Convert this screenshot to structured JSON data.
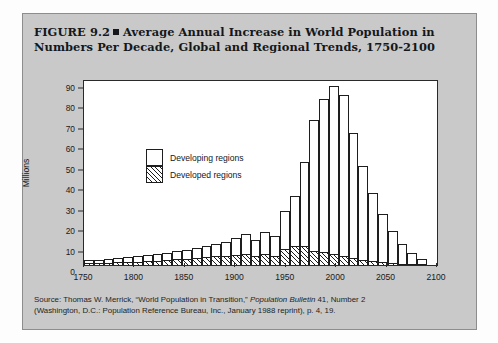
{
  "figure": {
    "title_line1": "FIGURE 9.2",
    "title_marker": "square-bullet",
    "title_line1b": "Average Annual Increase in World Population in",
    "title_line2": "Numbers Per Decade, Global and Regional Trends, 1750-2100",
    "source_line1_a": "Source: Thomas W. Merrick, “World Population in Transition,” ",
    "source_line1_italic": "Population Bulletin",
    "source_line1_b": " 41, Number 2",
    "source_line2": "(Washington, D.C.: Population Reference Bureau, Inc., January 1988 reprint), p. 4, 19."
  },
  "chart_data": {
    "type": "bar",
    "stacked": true,
    "title": "Average Annual Increase in World Population in Numbers Per Decade, Global and Regional Trends, 1750-2100",
    "xlabel": "",
    "ylabel": "Millions",
    "xlim": [
      1750,
      2100
    ],
    "ylim": [
      0,
      90
    ],
    "ytick_step": 10,
    "xtick_step": 50,
    "grid": false,
    "legend_position": "inside-upper-left",
    "yticks": [
      0,
      10,
      20,
      30,
      40,
      50,
      60,
      70,
      80,
      90
    ],
    "ytick_labels": [
      "0",
      "10",
      "20",
      "30",
      "40",
      "50",
      "60",
      "70",
      "80",
      "90"
    ],
    "xticks": [
      1750,
      1800,
      1850,
      1900,
      1950,
      2000,
      2050,
      2100
    ],
    "xtick_labels": [
      "1750",
      "1800",
      "1850",
      "1900",
      "1950",
      "2000",
      "2050",
      "2100"
    ],
    "categories": [
      1750,
      1760,
      1770,
      1780,
      1790,
      1800,
      1810,
      1820,
      1830,
      1840,
      1850,
      1860,
      1870,
      1880,
      1890,
      1900,
      1910,
      1920,
      1930,
      1940,
      1950,
      1960,
      1970,
      1980,
      1990,
      2000,
      2010,
      2020,
      2030,
      2040,
      2050,
      2060,
      2070,
      2080,
      2090
    ],
    "series": [
      {
        "name": "Developed regions",
        "pattern": "diagonal-hatch",
        "color": "#ffffff",
        "values": [
          1.0,
          1.1,
          1.2,
          1.3,
          1.5,
          1.7,
          1.9,
          2.2,
          2.5,
          2.8,
          3.1,
          3.4,
          3.8,
          4.2,
          4.6,
          5.1,
          5.4,
          4.2,
          5.6,
          4.6,
          8.0,
          9.4,
          9.2,
          6.9,
          6.4,
          5.4,
          4.4,
          3.4,
          2.6,
          1.9,
          1.4,
          1.0,
          0.7,
          0.5,
          0.3
        ]
      },
      {
        "name": "Developing regions",
        "pattern": "solid-white",
        "color": "#ffffff",
        "values": [
          1.4,
          1.6,
          1.8,
          2.0,
          2.2,
          2.5,
          2.8,
          3.1,
          3.5,
          3.9,
          4.4,
          4.9,
          5.5,
          6.2,
          6.9,
          8.0,
          9.6,
          8.0,
          10.4,
          9.4,
          18.5,
          24.6,
          41.4,
          64.0,
          74.7,
          82.0,
          78.6,
          61.0,
          46.0,
          33.4,
          23.4,
          15.6,
          9.8,
          5.3,
          2.4
        ]
      }
    ],
    "totals": [
      2.4,
      2.7,
      3.0,
      3.3,
      3.7,
      4.2,
      4.7,
      5.3,
      6.0,
      6.7,
      7.5,
      8.3,
      9.3,
      10.4,
      11.5,
      13.1,
      15.0,
      12.2,
      16.0,
      14.0,
      26.5,
      34.0,
      50.6,
      70.9,
      81.1,
      87.4,
      83.0,
      64.4,
      48.6,
      35.3,
      24.8,
      16.6,
      10.5,
      5.8,
      2.7
    ],
    "peak_value": 87.4,
    "peak_category": 2000
  },
  "legend": {
    "items": [
      {
        "label": "Developing regions",
        "style": "solid-white"
      },
      {
        "label": "Developed regions",
        "style": "diagonal-hatch"
      }
    ]
  },
  "colors": {
    "panel_background": "#c9c9c9",
    "plot_background": "#ffffff",
    "axis": "#2a2a2a",
    "text": "#15171a",
    "page_background": "#fdfdfd"
  }
}
